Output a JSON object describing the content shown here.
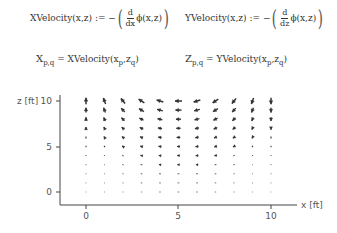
{
  "equations": {
    "xvel_def": {
      "lhs": "XVelocity(x,z)",
      "op": ":=",
      "minus": "−",
      "d_num": "d",
      "d_den": "dx",
      "fn": "ϕ(x,z)"
    },
    "yvel_def": {
      "lhs": "YVelocity(x,z)",
      "op": ":=",
      "minus": "−",
      "d_num": "d",
      "d_den": "dz",
      "fn": "ϕ(x,z)"
    },
    "x_assign": {
      "lhs": "X",
      "lhs_sub": "p,q",
      "op": "=",
      "rhs_fn": "XVelocity",
      "arg1": "x",
      "arg1_sub": "p",
      "arg2": "z",
      "arg2_sub": "q"
    },
    "z_assign": {
      "lhs": "Z",
      "lhs_sub": "p,q",
      "op": "=",
      "rhs_fn": "YVelocity",
      "arg1": "x",
      "arg1_sub": "p",
      "arg2": "z",
      "arg2_sub": "q"
    }
  },
  "chart_data": {
    "type": "quiver",
    "title": "",
    "xlabel": "x [ft]",
    "ylabel": "z [ft]",
    "xlim": [
      -1.4,
      11.5
    ],
    "ylim": [
      -1.4,
      11
    ],
    "xticks": [
      0,
      5,
      10
    ],
    "yticks": [
      0,
      5,
      10
    ],
    "x": [
      0,
      1,
      2,
      3,
      4,
      5,
      6,
      7,
      8,
      9,
      10
    ],
    "z": [
      0,
      1,
      2,
      3,
      4,
      5,
      6,
      7,
      8,
      9,
      10
    ],
    "grid": false
  }
}
